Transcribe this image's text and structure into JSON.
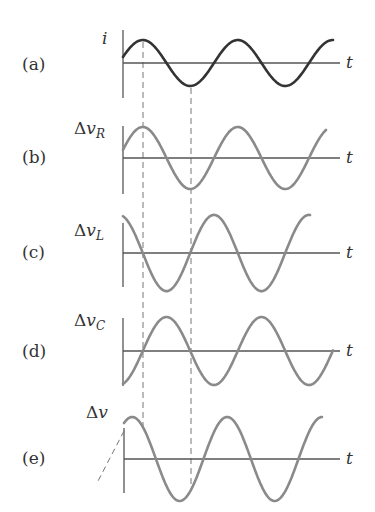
{
  "figure": {
    "colors": {
      "current_curve": "#333333",
      "voltage_curve": "#8a8a8a",
      "axis": "#555555",
      "guide": "#777777"
    },
    "time_axis_label": "t",
    "panels": [
      {
        "id": "a",
        "label": "(a)",
        "quantity": "i",
        "delta": "",
        "subscript": "",
        "phase": "sin",
        "color_key": "current_curve"
      },
      {
        "id": "b",
        "label": "(b)",
        "quantity": "v",
        "delta": "Δ",
        "subscript": "R",
        "phase": "sin",
        "color_key": "voltage_curve"
      },
      {
        "id": "c",
        "label": "(c)",
        "quantity": "v",
        "delta": "Δ",
        "subscript": "L",
        "phase": "cos",
        "color_key": "voltage_curve"
      },
      {
        "id": "d",
        "label": "(d)",
        "quantity": "v",
        "delta": "Δ",
        "subscript": "C",
        "phase": "-cos",
        "color_key": "voltage_curve"
      },
      {
        "id": "e",
        "label": "(e)",
        "quantity": "v",
        "delta": "Δ",
        "subscript": "",
        "phase": "sin+offset",
        "color_key": "voltage_curve"
      }
    ]
  },
  "chart_data": {
    "type": "line",
    "title": "",
    "xlabel": "t",
    "series": [
      {
        "name": "i",
        "phase_deg": 0,
        "amplitude": 1.0
      },
      {
        "name": "Δv_R",
        "phase_deg": 0,
        "amplitude": 1.0
      },
      {
        "name": "Δv_L",
        "phase_deg": 90,
        "amplitude": 1.15
      },
      {
        "name": "Δv_C",
        "phase_deg": -90,
        "amplitude": 1.0
      },
      {
        "name": "Δv",
        "phase_deg": 40,
        "amplitude": 1.25
      }
    ],
    "guides": [
      {
        "type": "dashed-vertical",
        "at": "first peak of i"
      },
      {
        "type": "dashed-vertical",
        "at": "first trough of i"
      }
    ],
    "periods_shown": 2.2
  }
}
